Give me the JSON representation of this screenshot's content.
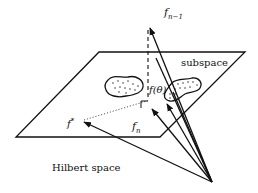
{
  "figure": {
    "labels": {
      "f_n_minus_1": "f",
      "f_n_minus_1_sub": "n−1",
      "subspace": "subspace",
      "f_theta": "f(θ)",
      "f_star": "f",
      "f_star_sup": "*",
      "f_n": "f",
      "f_n_sub": "n",
      "hilbert_space": "Hilbert space"
    },
    "colors": {
      "ink": "#111111",
      "background": "#ffffff"
    }
  }
}
